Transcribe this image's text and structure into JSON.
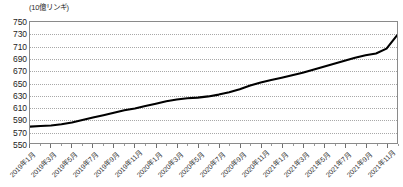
{
  "chart_data": {
    "type": "line",
    "title": "",
    "subtitle": "",
    "unit_label": "(10億リンギ)",
    "xlabel": "",
    "ylabel": "",
    "ylim": [
      550,
      750
    ],
    "ytick_step": 20,
    "yticks": [
      750,
      730,
      710,
      690,
      670,
      650,
      630,
      610,
      590,
      570,
      550
    ],
    "grid": {
      "horizontal": true,
      "vertical": false,
      "style": "dotted",
      "color": "#a8a8a8"
    },
    "legend": {
      "visible": false,
      "position": "none"
    },
    "x": [
      "2019年1月",
      "2019年2月",
      "2019年3月",
      "2019年4月",
      "2019年5月",
      "2019年6月",
      "2019年7月",
      "2019年8月",
      "2019年9月",
      "2019年10月",
      "2019年11月",
      "2019年12月",
      "2020年1月",
      "2020年2月",
      "2020年3月",
      "2020年4月",
      "2020年5月",
      "2020年6月",
      "2020年7月",
      "2020年8月",
      "2020年9月",
      "2020年10月",
      "2020年11月",
      "2020年12月",
      "2021年1月",
      "2021年2月",
      "2021年3月",
      "2021年4月",
      "2021年5月",
      "2021年6月",
      "2021年7月",
      "2021年8月",
      "2021年9月",
      "2021年10月",
      "2021年11月",
      "2021年12月"
    ],
    "xtick_labels": [
      "2019年1月",
      "2019年3月",
      "2019年5月",
      "2019年7月",
      "2019年9月",
      "2019年11月",
      "2020年1月",
      "2020年3月",
      "2020年5月",
      "2020年7月",
      "2020年9月",
      "2020年11月",
      "2021年1月",
      "2021年3月",
      "2021年5月",
      "2021年7月",
      "2021年9月",
      "2021年11月"
    ],
    "xtick_every_n_points": 2,
    "series": [
      {
        "name": "残高",
        "color": "#000000",
        "line_width": 2.1,
        "markers": false,
        "values": [
          577,
          578,
          579,
          581,
          584,
          588,
          592,
          596,
          600,
          604,
          607,
          611,
          615,
          619,
          622,
          624,
          625,
          627,
          630,
          634,
          639,
          645,
          650,
          654,
          658,
          662,
          666,
          671,
          676,
          681,
          686,
          691,
          695,
          698,
          706,
          728
        ]
      }
    ]
  }
}
